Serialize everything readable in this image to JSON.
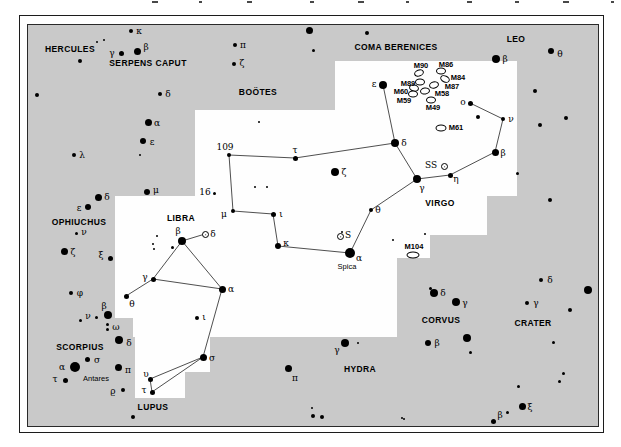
{
  "map": {
    "bg_color": "#c9c9c9",
    "highlight_color": "#fefefe",
    "star_color": "#000000",
    "line_color": "#222222",
    "frame": {
      "outer": {
        "x": 19,
        "y": 15,
        "w": 583,
        "h": 416
      },
      "inner": {
        "x": 27,
        "y": 24,
        "w": 570,
        "h": 401
      }
    },
    "white_patches": [
      {
        "x": 335,
        "y": 61,
        "w": 182,
        "h": 135
      },
      {
        "x": 195,
        "y": 110,
        "w": 140,
        "h": 86
      },
      {
        "x": 115,
        "y": 196,
        "w": 372,
        "h": 39
      },
      {
        "x": 115,
        "y": 235,
        "w": 315,
        "h": 23
      },
      {
        "x": 115,
        "y": 258,
        "w": 282,
        "h": 60
      },
      {
        "x": 133,
        "y": 318,
        "w": 264,
        "h": 19
      },
      {
        "x": 135,
        "y": 337,
        "w": 75,
        "h": 35
      },
      {
        "x": 135,
        "y": 372,
        "w": 50,
        "h": 26
      }
    ],
    "constellations": [
      {
        "name": "HERCULES",
        "x": 70,
        "y": 49
      },
      {
        "name": "SERPENS CAPUT",
        "x": 148,
        "y": 63
      },
      {
        "name": "BOÖTES",
        "x": 258,
        "y": 92
      },
      {
        "name": "COMA BERENICES",
        "x": 396,
        "y": 47
      },
      {
        "name": "LEO",
        "x": 516,
        "y": 39
      },
      {
        "name": "VIRGO",
        "x": 440,
        "y": 203
      },
      {
        "name": "OPHIUCHUS",
        "x": 79,
        "y": 222
      },
      {
        "name": "LIBRA",
        "x": 181,
        "y": 218
      },
      {
        "name": "SCORPIUS",
        "x": 80,
        "y": 347
      },
      {
        "name": "LUPUS",
        "x": 153,
        "y": 407
      },
      {
        "name": "HYDRA",
        "x": 360,
        "y": 369
      },
      {
        "name": "CORVUS",
        "x": 441,
        "y": 320
      },
      {
        "name": "CRATER",
        "x": 533,
        "y": 323
      }
    ],
    "star_names": [
      {
        "text": "Antares",
        "x": 96,
        "y": 379
      },
      {
        "text": "Spica",
        "x": 347,
        "y": 267
      }
    ],
    "stars": [
      {
        "x": 97,
        "y": 42,
        "r": 1
      },
      {
        "x": 104,
        "y": 40,
        "r": 1
      },
      {
        "x": 131,
        "y": 31,
        "r": 2,
        "l": "κ",
        "lx": 139,
        "ly": 31
      },
      {
        "x": 121,
        "y": 53,
        "r": 2.5,
        "l": "γ",
        "lx": 112,
        "ly": 53
      },
      {
        "x": 137,
        "y": 51,
        "r": 3.5,
        "l": "β",
        "lx": 146,
        "ly": 47
      },
      {
        "x": 80,
        "y": 61,
        "r": 2
      },
      {
        "x": 37,
        "y": 95,
        "r": 2
      },
      {
        "x": 160,
        "y": 94,
        "r": 2,
        "l": "δ",
        "lx": 168,
        "ly": 94
      },
      {
        "x": 148,
        "y": 122,
        "r": 3.5,
        "l": "α",
        "lx": 157,
        "ly": 123
      },
      {
        "x": 143,
        "y": 141,
        "r": 3,
        "l": "ε",
        "lx": 152,
        "ly": 142
      },
      {
        "x": 74,
        "y": 155,
        "r": 2,
        "l": "λ",
        "lx": 82,
        "ly": 155
      },
      {
        "x": 140,
        "y": 155,
        "r": 1
      },
      {
        "x": 147,
        "y": 192,
        "r": 3,
        "l": "μ",
        "lx": 156,
        "ly": 190
      },
      {
        "x": 235,
        "y": 45,
        "r": 2,
        "l": "π",
        "lx": 243,
        "ly": 45
      },
      {
        "x": 234,
        "y": 64,
        "r": 2,
        "l": "ζ",
        "lx": 242,
        "ly": 63
      },
      {
        "x": 309,
        "y": 30,
        "r": 3.5
      },
      {
        "x": 313,
        "y": 50,
        "r": 1.5
      },
      {
        "x": 367,
        "y": 33,
        "r": 2
      },
      {
        "x": 98,
        "y": 197,
        "r": 3.5,
        "l": "δ",
        "lx": 107,
        "ly": 197
      },
      {
        "x": 88,
        "y": 207,
        "r": 3,
        "l": "ε",
        "lx": 79,
        "ly": 208
      },
      {
        "x": 76,
        "y": 233,
        "r": 1.5,
        "l": "ν",
        "lx": 84,
        "ly": 232
      },
      {
        "x": 64,
        "y": 251,
        "r": 3.5,
        "l": "ζ",
        "lx": 73,
        "ly": 252
      },
      {
        "x": 110,
        "y": 258,
        "r": 2.5,
        "l": "ξ",
        "lx": 101,
        "ly": 255
      },
      {
        "x": 71,
        "y": 293,
        "r": 2,
        "l": "φ",
        "lx": 80,
        "ly": 293
      },
      {
        "x": 108,
        "y": 315,
        "r": 4,
        "l": "β",
        "lx": 104,
        "ly": 306
      },
      {
        "x": 96,
        "y": 317,
        "r": 1.5,
        "l": "ν",
        "lx": 88,
        "ly": 316
      },
      {
        "x": 80,
        "y": 320,
        "r": 1.5
      },
      {
        "x": 107,
        "y": 324,
        "r": 1.5
      },
      {
        "x": 107,
        "y": 329,
        "r": 1.5,
        "l": "ω",
        "lx": 116,
        "ly": 327
      },
      {
        "x": 119,
        "y": 340,
        "r": 4,
        "l": "δ",
        "lx": 129,
        "ly": 343
      },
      {
        "x": 87,
        "y": 359,
        "r": 2.5,
        "l": "σ",
        "lx": 97,
        "ly": 360
      },
      {
        "x": 75,
        "y": 367,
        "r": 5,
        "l": "α",
        "lx": 62,
        "ly": 367
      },
      {
        "x": 65,
        "y": 380,
        "r": 2.5,
        "l": "τ",
        "lx": 55,
        "ly": 379
      },
      {
        "x": 118,
        "y": 367,
        "r": 3.5,
        "l": "π",
        "lx": 128,
        "ly": 370
      },
      {
        "x": 123,
        "y": 390,
        "r": 2,
        "l": "ϱ",
        "lx": 113,
        "ly": 391
      },
      {
        "x": 133,
        "y": 417,
        "r": 2
      },
      {
        "x": 288,
        "y": 368,
        "r": 3.5,
        "l": "π",
        "lx": 295,
        "ly": 378
      },
      {
        "x": 345,
        "y": 343,
        "r": 4,
        "l": "γ",
        "lx": 337,
        "ly": 350
      },
      {
        "x": 358,
        "y": 343,
        "r": 1
      },
      {
        "x": 312,
        "y": 408,
        "r": 1
      },
      {
        "x": 313,
        "y": 416,
        "r": 2
      },
      {
        "x": 322,
        "y": 417,
        "r": 2
      },
      {
        "x": 402,
        "y": 418,
        "r": 1
      },
      {
        "x": 434,
        "y": 293,
        "r": 4,
        "l": "δ",
        "lx": 443,
        "ly": 293
      },
      {
        "x": 430,
        "y": 288,
        "r": 1.5
      },
      {
        "x": 456,
        "y": 302,
        "r": 4,
        "l": "γ",
        "lx": 465,
        "ly": 303
      },
      {
        "x": 428,
        "y": 343,
        "r": 3,
        "l": "β",
        "lx": 437,
        "ly": 343
      },
      {
        "x": 467,
        "y": 338,
        "r": 4
      },
      {
        "x": 470,
        "y": 352,
        "r": 1.5
      },
      {
        "x": 527,
        "y": 303,
        "r": 2,
        "l": "γ",
        "lx": 536,
        "ly": 303
      },
      {
        "x": 541,
        "y": 280,
        "r": 2,
        "l": "δ",
        "lx": 550,
        "ly": 280
      },
      {
        "x": 553,
        "y": 342,
        "r": 1.5
      },
      {
        "x": 570,
        "y": 310,
        "r": 2
      },
      {
        "x": 588,
        "y": 290,
        "r": 4
      },
      {
        "x": 496,
        "y": 59,
        "r": 4,
        "l": "β",
        "lx": 505,
        "ly": 59
      },
      {
        "x": 551,
        "y": 51,
        "r": 3,
        "l": "θ",
        "lx": 560,
        "ly": 54
      },
      {
        "x": 535,
        "y": 91,
        "r": 2
      },
      {
        "x": 566,
        "y": 118,
        "r": 2
      },
      {
        "x": 540,
        "y": 125,
        "r": 2
      },
      {
        "x": 550,
        "y": 200,
        "r": 2
      },
      {
        "x": 522,
        "y": 406,
        "r": 3.5,
        "l": "ξ",
        "lx": 530,
        "ly": 407
      },
      {
        "x": 493,
        "y": 421,
        "r": 2.5,
        "l": "β",
        "lx": 500,
        "ly": 415
      },
      {
        "x": 507,
        "y": 412,
        "r": 1.5
      },
      {
        "x": 518,
        "y": 386,
        "r": 1.5
      },
      {
        "x": 559,
        "y": 381,
        "r": 1.5
      },
      {
        "x": 563,
        "y": 373,
        "r": 1.5
      },
      {
        "x": 404,
        "y": 419,
        "r": 1
      },
      {
        "x": 229,
        "y": 155,
        "r": 2,
        "l": "109",
        "lx": 225,
        "ly": 147
      },
      {
        "x": 295,
        "y": 158,
        "r": 2.5,
        "l": "τ",
        "lx": 295,
        "ly": 150
      },
      {
        "x": 259,
        "y": 122,
        "r": 1
      },
      {
        "x": 255,
        "y": 187,
        "r": 1
      },
      {
        "x": 267,
        "y": 187,
        "r": 1
      },
      {
        "x": 395,
        "y": 143,
        "r": 4,
        "l": "δ",
        "lx": 404,
        "ly": 143
      },
      {
        "x": 383,
        "y": 85,
        "r": 4,
        "l": "ε",
        "lx": 374,
        "ly": 84
      },
      {
        "x": 335,
        "y": 172,
        "r": 4,
        "l": "ζ",
        "lx": 344,
        "ly": 172
      },
      {
        "x": 214,
        "y": 193,
        "r": 1.5,
        "l": "16",
        "lx": 205,
        "ly": 192
      },
      {
        "x": 233,
        "y": 211,
        "r": 2,
        "l": "μ",
        "lx": 224,
        "ly": 214
      },
      {
        "x": 273,
        "y": 214,
        "r": 2.5,
        "l": "ι",
        "lx": 281,
        "ly": 214
      },
      {
        "x": 278,
        "y": 246,
        "r": 3,
        "l": "κ",
        "lx": 286,
        "ly": 243
      },
      {
        "x": 371,
        "y": 210,
        "r": 2,
        "l": "θ",
        "lx": 378,
        "ly": 210
      },
      {
        "x": 350,
        "y": 253,
        "r": 5,
        "l": "α",
        "lx": 359,
        "ly": 258
      },
      {
        "x": 417,
        "y": 179,
        "r": 4,
        "l": "γ",
        "lx": 422,
        "ly": 188
      },
      {
        "x": 450,
        "y": 175,
        "r": 2.5,
        "l": "η",
        "lx": 456,
        "ly": 179
      },
      {
        "x": 495,
        "y": 152,
        "r": 3.5,
        "l": "β",
        "lx": 503,
        "ly": 153
      },
      {
        "x": 503,
        "y": 119,
        "r": 2,
        "l": "ν",
        "lx": 511,
        "ly": 119
      },
      {
        "x": 470,
        "y": 103,
        "r": 2.5,
        "l": "o",
        "lx": 463,
        "ly": 102
      },
      {
        "x": 478,
        "y": 117,
        "r": 2
      },
      {
        "x": 517,
        "y": 173,
        "r": 1.5
      },
      {
        "x": 342,
        "y": 232,
        "r": 1
      },
      {
        "x": 393,
        "y": 240,
        "r": 1
      },
      {
        "x": 425,
        "y": 234,
        "r": 1
      },
      {
        "x": 182,
        "y": 241,
        "r": 4,
        "l": "β",
        "lx": 178,
        "ly": 231
      },
      {
        "x": 153,
        "y": 279,
        "r": 2.5,
        "l": "γ",
        "lx": 145,
        "ly": 277
      },
      {
        "x": 222,
        "y": 289,
        "r": 3.5,
        "l": "α",
        "lx": 231,
        "ly": 289
      },
      {
        "x": 126,
        "y": 296,
        "r": 2.5,
        "l": "θ",
        "lx": 132,
        "ly": 304
      },
      {
        "x": 203,
        "y": 357,
        "r": 3.5,
        "l": "σ",
        "lx": 212,
        "ly": 358
      },
      {
        "x": 197,
        "y": 318,
        "r": 2,
        "l": "ι",
        "lx": 204,
        "ly": 317
      },
      {
        "x": 150,
        "y": 379,
        "r": 2.5,
        "l": "υ",
        "lx": 146,
        "ly": 374
      },
      {
        "x": 152,
        "y": 392,
        "r": 2.5,
        "l": "τ",
        "lx": 144,
        "ly": 390
      },
      {
        "x": 157,
        "y": 236,
        "r": 1
      },
      {
        "x": 153,
        "y": 244,
        "r": 1
      },
      {
        "x": 154,
        "y": 249,
        "r": 1
      },
      {
        "x": 172,
        "y": 247,
        "r": 1.5
      }
    ],
    "lines": [
      [
        383,
        85,
        395,
        143
      ],
      [
        395,
        143,
        417,
        179
      ],
      [
        417,
        179,
        450,
        175
      ],
      [
        450,
        175,
        495,
        152
      ],
      [
        495,
        152,
        503,
        119
      ],
      [
        503,
        119,
        470,
        103
      ],
      [
        417,
        179,
        371,
        210
      ],
      [
        371,
        210,
        350,
        253
      ],
      [
        350,
        253,
        278,
        246
      ],
      [
        278,
        246,
        273,
        214
      ],
      [
        273,
        214,
        233,
        211
      ],
      [
        233,
        211,
        229,
        155
      ],
      [
        229,
        155,
        295,
        158
      ],
      [
        295,
        158,
        395,
        143
      ],
      [
        182,
        241,
        205,
        234
      ],
      [
        182,
        241,
        153,
        279
      ],
      [
        182,
        241,
        222,
        289
      ],
      [
        153,
        279,
        222,
        289
      ],
      [
        153,
        279,
        126,
        296
      ],
      [
        222,
        289,
        203,
        357
      ],
      [
        203,
        357,
        150,
        379
      ],
      [
        203,
        357,
        152,
        392
      ],
      [
        150,
        379,
        152,
        392
      ]
    ],
    "galaxies": [
      {
        "x": 419,
        "y": 73,
        "w": 8,
        "h": 5,
        "rot": -20
      },
      {
        "x": 441,
        "y": 71,
        "w": 8,
        "h": 5,
        "rot": 0
      },
      {
        "x": 445,
        "y": 79,
        "w": 8,
        "h": 5,
        "rot": 25
      },
      {
        "x": 420,
        "y": 82,
        "w": 8,
        "h": 5,
        "rot": 0
      },
      {
        "x": 434,
        "y": 85,
        "w": 8,
        "h": 5,
        "rot": -15
      },
      {
        "x": 414,
        "y": 88,
        "w": 8,
        "h": 5,
        "rot": 15
      },
      {
        "x": 413,
        "y": 94,
        "w": 8,
        "h": 5,
        "rot": 0
      },
      {
        "x": 425,
        "y": 91,
        "w": 8,
        "h": 5,
        "rot": -10
      },
      {
        "x": 431,
        "y": 100,
        "w": 8,
        "h": 5,
        "rot": 0
      },
      {
        "x": 441,
        "y": 128,
        "w": 9,
        "h": 5,
        "rot": 0
      },
      {
        "x": 413,
        "y": 255,
        "w": 11,
        "h": 5,
        "rot": 0
      }
    ],
    "galaxy_labels": [
      {
        "text": "M90",
        "x": 421,
        "y": 66
      },
      {
        "text": "M86",
        "x": 446,
        "y": 65
      },
      {
        "text": "M84",
        "x": 458,
        "y": 78
      },
      {
        "text": "M89",
        "x": 408,
        "y": 84
      },
      {
        "text": "M87",
        "x": 452,
        "y": 87
      },
      {
        "text": "M60",
        "x": 401,
        "y": 92
      },
      {
        "text": "M58",
        "x": 442,
        "y": 94
      },
      {
        "text": "M59",
        "x": 404,
        "y": 101
      },
      {
        "text": "M49",
        "x": 433,
        "y": 108
      },
      {
        "text": "M61",
        "x": 456,
        "y": 128
      },
      {
        "text": "M104",
        "x": 414,
        "y": 247
      }
    ],
    "variable_stars": [
      {
        "x": 205,
        "y": 234,
        "l": "δ",
        "lx": 213,
        "ly": 234
      },
      {
        "x": 340,
        "y": 236,
        "l": "S",
        "lx": 348,
        "ly": 235
      },
      {
        "x": 444,
        "y": 166,
        "l": "SS",
        "lx": 431,
        "ly": 165
      }
    ],
    "top_crop_marks": [
      {
        "x": 152,
        "w": 6
      },
      {
        "x": 199,
        "w": 3
      },
      {
        "x": 247,
        "w": 5
      },
      {
        "x": 310,
        "w": 4
      },
      {
        "x": 358,
        "w": 6
      },
      {
        "x": 406,
        "w": 3
      },
      {
        "x": 467,
        "w": 5
      },
      {
        "x": 515,
        "w": 4
      },
      {
        "x": 563,
        "w": 6
      },
      {
        "x": 611,
        "w": 3
      }
    ]
  }
}
